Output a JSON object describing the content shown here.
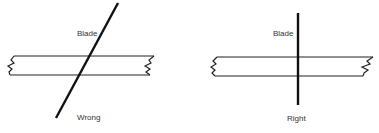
{
  "diagram": {
    "panels": [
      {
        "id": "wrong",
        "blade_label": "Blade",
        "caption": "Wrong",
        "blade_orientation": "slanted"
      },
      {
        "id": "right",
        "blade_label": "Blade",
        "caption": "Right",
        "blade_orientation": "perpendicular"
      }
    ],
    "colors": {
      "line": "#1a1a1a",
      "text": "#333333",
      "background": "#ffffff"
    }
  }
}
